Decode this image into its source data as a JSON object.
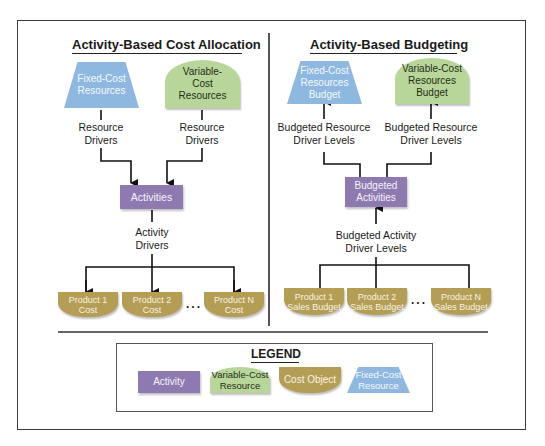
{
  "left_panel": {
    "title": "Activity-Based Cost Allocation",
    "fixed_node": [
      "Fixed-Cost",
      "Resources"
    ],
    "variable_node": [
      "Variable-",
      "Cost",
      "Resources"
    ],
    "resource_drivers_left": [
      "Resource",
      "Drivers"
    ],
    "resource_drivers_right": [
      "Resource",
      "Drivers"
    ],
    "activities_node": "Activities",
    "activity_drivers": [
      "Activity",
      "Drivers"
    ],
    "products": [
      [
        "Product 1",
        "Cost"
      ],
      [
        "Product 2",
        "Cost"
      ],
      [
        "Product N",
        "Cost"
      ]
    ],
    "ellipsis": "..."
  },
  "right_panel": {
    "title": "Activity-Based Budgeting",
    "fixed_node": [
      "Fixed-Cost",
      "Resources",
      "Budget"
    ],
    "variable_node": [
      "Variable-Cost",
      "Resources",
      "Budget"
    ],
    "resource_levels_left": [
      "Budgeted Resource",
      "Driver Levels"
    ],
    "resource_levels_right": [
      "Budgeted Resource",
      "Driver Levels"
    ],
    "activities_node": [
      "Budgeted",
      "Activities"
    ],
    "activity_levels": [
      "Budgeted Activity",
      "Driver Levels"
    ],
    "products": [
      [
        "Product 1",
        "Sales Budget"
      ],
      [
        "Product 2",
        "Sales Budget"
      ],
      [
        "Product N",
        "Sales Budget"
      ]
    ],
    "ellipsis": "..."
  },
  "legend": {
    "title": "LEGEND",
    "items": [
      {
        "shape": "activity",
        "label": [
          "Activity"
        ]
      },
      {
        "shape": "variable",
        "label": [
          "Variable-Cost",
          "Resource"
        ]
      },
      {
        "shape": "cost-object",
        "label": [
          "Cost Object"
        ]
      },
      {
        "shape": "fixed",
        "label": [
          "Fixed-Cost",
          "Resource"
        ]
      }
    ]
  },
  "colors": {
    "fixed": "#8fb8e0",
    "variable": "#b9d69a",
    "activity": "#8e7ab0",
    "cost_object": "#b49d55"
  }
}
